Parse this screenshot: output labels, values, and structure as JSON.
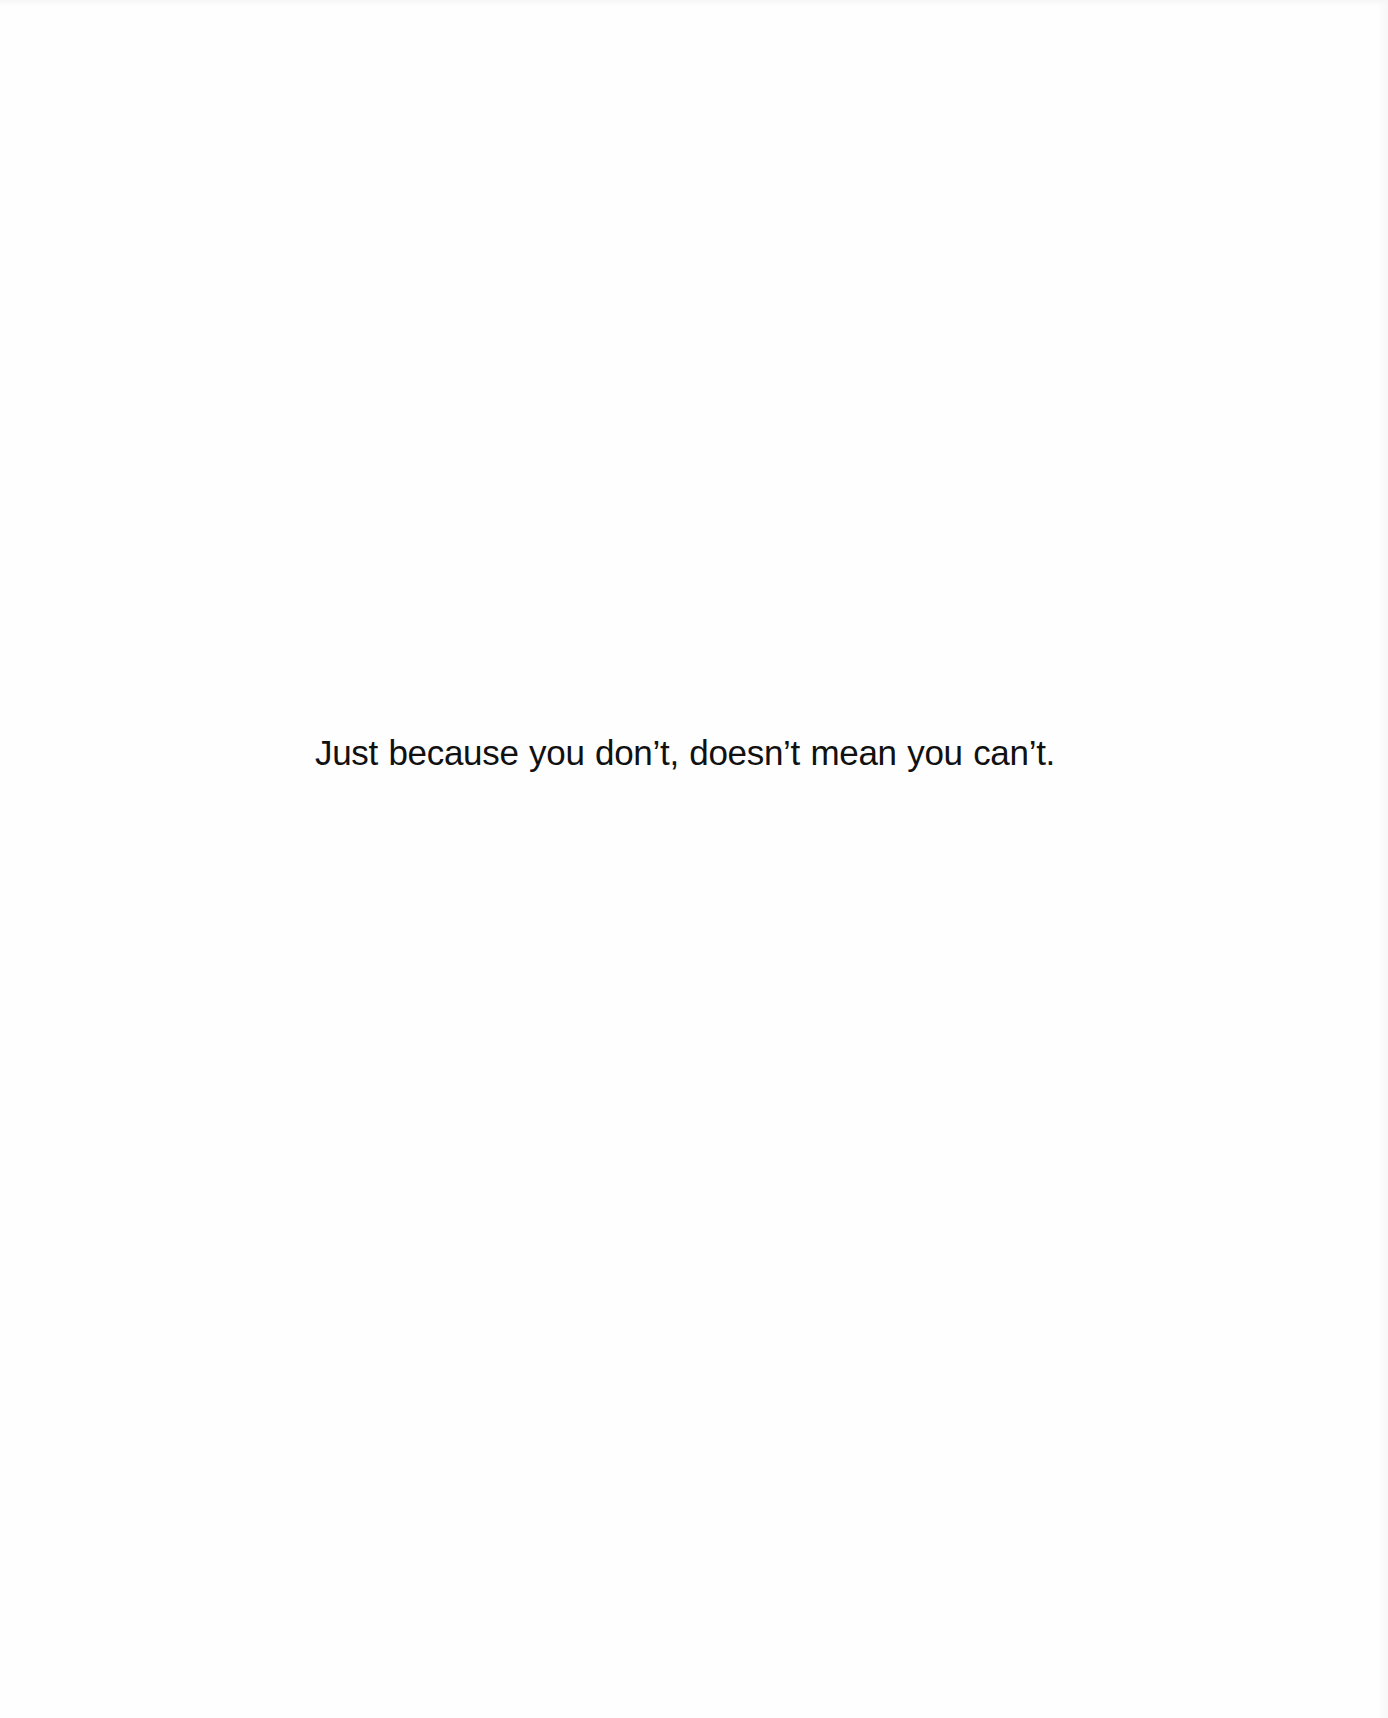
{
  "document": {
    "quote": "Just because you don’t, doesn’t mean you can’t."
  }
}
